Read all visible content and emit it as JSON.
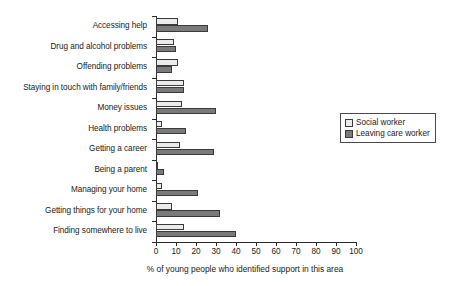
{
  "chart_data": {
    "type": "bar",
    "orientation": "horizontal",
    "title": "",
    "xlabel": "% of young people who identified support in this area",
    "ylabel": "",
    "xlim": [
      0,
      100
    ],
    "xticks": [
      0,
      10,
      20,
      30,
      40,
      50,
      60,
      70,
      80,
      90,
      100
    ],
    "grid": false,
    "legend_position": "right",
    "categories": [
      "Accessing help",
      "Drug and alcohol problems",
      "Offending problems",
      "Staying in touch with family/friends",
      "Money issues",
      "Health problems",
      "Getting a career",
      "Being a parent",
      "Managing your home",
      "Getting things for your home",
      "Finding somewhere to live"
    ],
    "series": [
      {
        "name": "Social worker",
        "color": "#ebebeb",
        "values": [
          11,
          9,
          11,
          14,
          13,
          3,
          12,
          1,
          3,
          8,
          14
        ]
      },
      {
        "name": "Leaving care worker",
        "color": "#7a7a7a",
        "values": [
          26,
          10,
          8,
          14,
          30,
          15,
          29,
          4,
          21,
          32,
          40
        ]
      }
    ]
  },
  "legend": {
    "items": [
      {
        "label": "Social worker",
        "swatch": "social-worker-swatch"
      },
      {
        "label": "Leaving care worker",
        "swatch": "leaving-care-worker-swatch"
      }
    ]
  }
}
